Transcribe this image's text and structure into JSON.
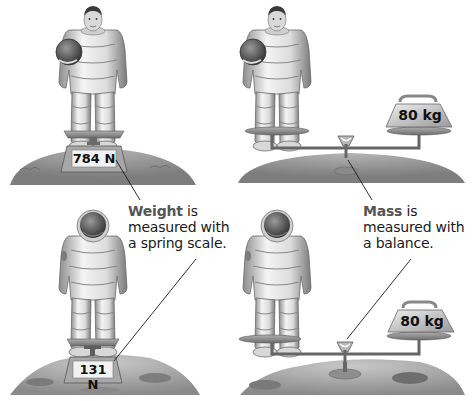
{
  "figure": {
    "panels": [
      {
        "id": "earth-spring-scale",
        "location": "Earth",
        "instrument": "spring scale",
        "reading": "784 N"
      },
      {
        "id": "earth-balance",
        "location": "Earth",
        "instrument": "balance",
        "reading": "80 kg"
      },
      {
        "id": "moon-spring-scale",
        "location": "Moon",
        "instrument": "spring scale",
        "reading": "131 N"
      },
      {
        "id": "moon-balance",
        "location": "Moon",
        "instrument": "balance",
        "reading": "80 kg"
      }
    ],
    "weight_caption": {
      "term": "Weight",
      "line1_rest": " is",
      "line2": "measured with",
      "line3": "a spring scale."
    },
    "mass_caption": {
      "term": "Mass",
      "line1_rest": " is",
      "line2": "measured with",
      "line3": "a balance."
    },
    "colors": {
      "ground_earth": "#8e8e8e",
      "ground_moon": "#a8a8a8",
      "scale_body": "#9a9a9a",
      "label_face": "#f2f2f2",
      "leader_line": "#1a1a1a",
      "term_text": "#555555"
    }
  }
}
